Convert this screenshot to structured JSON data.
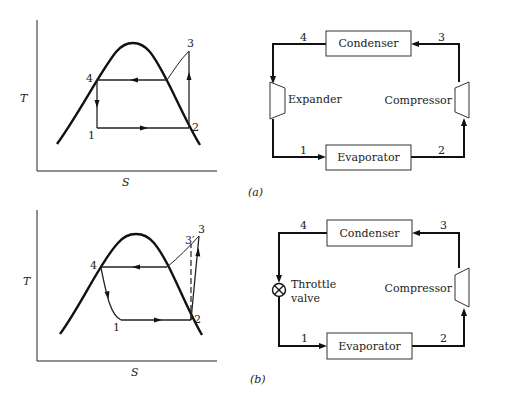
{
  "figure": {
    "panels": [
      {
        "id": "a",
        "caption": "(a)",
        "ts_diagram": {
          "y_axis_label": "T",
          "x_axis_label": "S",
          "states": [
            "1",
            "2",
            "3",
            "4"
          ]
        },
        "schematic": {
          "condenser": "Condenser",
          "evaporator": "Evaporator",
          "expansion_device": "Expander",
          "compressor": "Compressor",
          "node_labels": {
            "n1": "1",
            "n2": "2",
            "n3": "3",
            "n4": "4"
          }
        }
      },
      {
        "id": "b",
        "caption": "(b)",
        "ts_diagram": {
          "y_axis_label": "T",
          "x_axis_label": "S",
          "states": [
            "1",
            "2",
            "3",
            "3′",
            "4"
          ]
        },
        "schematic": {
          "condenser": "Condenser",
          "evaporator": "Evaporator",
          "expansion_device_line1": "Throttle",
          "expansion_device_line2": "valve",
          "compressor": "Compressor",
          "node_labels": {
            "n1": "1",
            "n2": "2",
            "n3": "3",
            "n4": "4"
          }
        }
      }
    ]
  }
}
